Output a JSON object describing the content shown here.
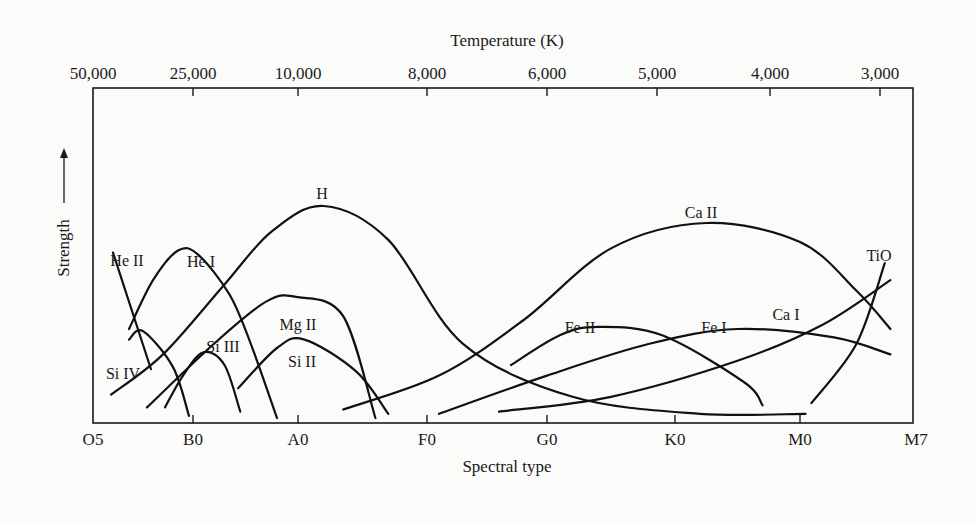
{
  "chart_data": {
    "type": "line",
    "title": "",
    "xlabel": "Spectral type",
    "ylabel": "Strength",
    "x2label": "Temperature (K)",
    "grid": false,
    "legend": "inline labels",
    "x_categories": [
      "O5",
      "B0",
      "A0",
      "F0",
      "G0",
      "K0",
      "M0",
      "M7"
    ],
    "x_positions": [
      0,
      1,
      2,
      3,
      4,
      5,
      6,
      7
    ],
    "top_axis_ticks": [
      "50,000",
      "25,000",
      "10,000",
      "8,000",
      "6,000",
      "5,000",
      "4,000",
      "3,000"
    ],
    "y_range": [
      0,
      1
    ],
    "y_ticks": [],
    "series": [
      {
        "name": "He II",
        "points": [
          [
            0.2,
            0.78
          ],
          [
            0.58,
            0.23
          ]
        ]
      },
      {
        "name": "He I",
        "points": [
          [
            0.36,
            0.42
          ],
          [
            0.6,
            0.65
          ],
          [
            0.85,
            0.79
          ],
          [
            1.05,
            0.77
          ],
          [
            1.35,
            0.58
          ],
          [
            1.55,
            0.35
          ],
          [
            1.8,
            0.0
          ]
        ]
      },
      {
        "name": "Si IV",
        "points": [
          [
            0.36,
            0.37
          ],
          [
            0.5,
            0.41
          ],
          [
            0.8,
            0.24
          ],
          [
            0.96,
            0.01
          ]
        ]
      },
      {
        "name": "Si III",
        "points": [
          [
            0.72,
            0.05
          ],
          [
            0.9,
            0.2
          ],
          [
            1.1,
            0.31
          ],
          [
            1.3,
            0.25
          ],
          [
            1.45,
            0.03
          ]
        ]
      },
      {
        "name": "H",
        "points": [
          [
            0.18,
            0.11
          ],
          [
            0.7,
            0.3
          ],
          [
            1.3,
            0.63
          ],
          [
            1.75,
            0.88
          ],
          [
            2.2,
            1.0
          ],
          [
            2.7,
            0.84
          ],
          [
            3.3,
            0.35
          ],
          [
            4.2,
            0.1
          ],
          [
            5.2,
            0.02
          ],
          [
            6.05,
            0.02
          ]
        ]
      },
      {
        "name": "Mg II",
        "points": [
          [
            0.54,
            0.05
          ],
          [
            1.2,
            0.35
          ],
          [
            1.7,
            0.55
          ],
          [
            2.0,
            0.57
          ],
          [
            2.35,
            0.48
          ],
          [
            2.6,
            0.0
          ]
        ]
      },
      {
        "name": "Si II",
        "points": [
          [
            1.43,
            0.14
          ],
          [
            1.8,
            0.33
          ],
          [
            2.05,
            0.37
          ],
          [
            2.45,
            0.22
          ],
          [
            2.7,
            0.02
          ]
        ]
      },
      {
        "name": "Ca II",
        "points": [
          [
            2.35,
            0.04
          ],
          [
            3.1,
            0.2
          ],
          [
            3.8,
            0.46
          ],
          [
            4.5,
            0.8
          ],
          [
            5.25,
            0.92
          ],
          [
            6.0,
            0.83
          ],
          [
            6.5,
            0.6
          ],
          [
            6.8,
            0.42
          ]
        ]
      },
      {
        "name": "Fe II",
        "points": [
          [
            3.7,
            0.25
          ],
          [
            4.1,
            0.39
          ],
          [
            4.4,
            0.43
          ],
          [
            4.9,
            0.39
          ],
          [
            5.55,
            0.17
          ],
          [
            5.7,
            0.06
          ]
        ]
      },
      {
        "name": "Fe I",
        "points": [
          [
            3.1,
            0.02
          ],
          [
            4.0,
            0.2
          ],
          [
            4.8,
            0.35
          ],
          [
            5.5,
            0.42
          ],
          [
            6.3,
            0.38
          ],
          [
            6.8,
            0.3
          ]
        ]
      },
      {
        "name": "Ca I",
        "points": [
          [
            3.6,
            0.03
          ],
          [
            4.5,
            0.1
          ],
          [
            5.5,
            0.27
          ],
          [
            6.2,
            0.44
          ],
          [
            6.8,
            0.65
          ]
        ]
      },
      {
        "name": "TiO",
        "points": [
          [
            6.1,
            0.07
          ],
          [
            6.5,
            0.35
          ],
          [
            6.75,
            0.73
          ]
        ]
      }
    ]
  },
  "labels": {
    "temperature_title": "Temperature (K)",
    "spectral_title": "Spectral type",
    "strength_title": "Strength"
  },
  "series_labels": [
    {
      "name": "He II",
      "x": 127,
      "y": 266
    },
    {
      "name": "He I",
      "x": 201,
      "y": 267
    },
    {
      "name": "Si IV",
      "x": 123,
      "y": 379
    },
    {
      "name": "Si III",
      "x": 223,
      "y": 352
    },
    {
      "name": "H",
      "x": 322,
      "y": 199
    },
    {
      "name": "Mg II",
      "x": 298,
      "y": 330
    },
    {
      "name": "Si II",
      "x": 302,
      "y": 367
    },
    {
      "name": "Ca II",
      "x": 701,
      "y": 218
    },
    {
      "name": "Fe II",
      "x": 580,
      "y": 333
    },
    {
      "name": "Fe I",
      "x": 714,
      "y": 333
    },
    {
      "name": "Ca I",
      "x": 786,
      "y": 320
    },
    {
      "name": "TiO",
      "x": 879,
      "y": 261
    }
  ]
}
